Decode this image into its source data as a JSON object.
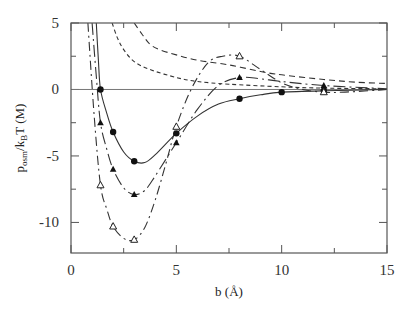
{
  "chart_data": {
    "type": "line",
    "title": "",
    "xlabel": "b  (Å)",
    "ylabel": "p_osm/k_BT (M)",
    "ylabel_parts": {
      "p": "p",
      "sub1": "osm",
      "mid": "/k",
      "sub2": "B",
      "end": "T (M)"
    },
    "xlim": [
      0,
      15
    ],
    "ylim": [
      -12.3,
      5
    ],
    "xticks": [
      0,
      5,
      10,
      15
    ],
    "yticks": [
      5,
      0,
      -5,
      -10
    ],
    "xtick_labels": [
      "0",
      "5",
      "10",
      "15"
    ],
    "ytick_labels": [
      "5",
      "0",
      "-5",
      "-10"
    ],
    "x_minor_ticks": [
      2.5,
      7.5,
      12.5
    ],
    "y_minor_ticks": [
      2.5,
      -2.5,
      -7.5
    ],
    "grid": false,
    "zero_line": true,
    "legend": null,
    "series": [
      {
        "name": "solid-filled-circles",
        "style": "solid",
        "marker": "filled-circle",
        "curve": [
          [
            1.2,
            5
          ],
          [
            1.3,
            2.2
          ],
          [
            1.4,
            0
          ],
          [
            1.7,
            -1.8
          ],
          [
            2,
            -3.2
          ],
          [
            2.5,
            -4.7
          ],
          [
            3,
            -5.4
          ],
          [
            3.5,
            -5.5
          ],
          [
            4,
            -4.9
          ],
          [
            5,
            -3.3
          ],
          [
            6,
            -2
          ],
          [
            7,
            -1.1
          ],
          [
            8,
            -0.7
          ],
          [
            9,
            -0.4
          ],
          [
            10,
            -0.2
          ],
          [
            12,
            -0.1
          ],
          [
            15,
            0
          ]
        ],
        "points": [
          [
            1.4,
            0
          ],
          [
            2,
            -3.2
          ],
          [
            3,
            -5.4
          ],
          [
            5,
            -3.3
          ],
          [
            8,
            -0.7
          ],
          [
            10,
            -0.2
          ],
          [
            12,
            -0.1
          ]
        ]
      },
      {
        "name": "long-dash-dot-filled-triangles",
        "style": "long-dash-dot",
        "marker": "filled-triangle",
        "curve": [
          [
            1.0,
            5
          ],
          [
            1.2,
            1
          ],
          [
            1.4,
            -2.5
          ],
          [
            1.7,
            -4.5
          ],
          [
            2,
            -6
          ],
          [
            2.5,
            -7.4
          ],
          [
            3,
            -7.9
          ],
          [
            3.5,
            -7.6
          ],
          [
            4,
            -6.5
          ],
          [
            5,
            -4
          ],
          [
            6,
            -1.5
          ],
          [
            7,
            0.3
          ],
          [
            8,
            0.9
          ],
          [
            9,
            0.8
          ],
          [
            10,
            0.6
          ],
          [
            12,
            0.3
          ],
          [
            15,
            0.05
          ]
        ],
        "points": [
          [
            1.4,
            -2.5
          ],
          [
            2,
            -6
          ],
          [
            3,
            -7.9
          ],
          [
            5,
            -4
          ],
          [
            8,
            0.9
          ],
          [
            12,
            0.3
          ]
        ]
      },
      {
        "name": "dash-dot-open-triangles",
        "style": "dash-dot",
        "marker": "open-triangle",
        "curve": [
          [
            0.8,
            5
          ],
          [
            1.1,
            -2
          ],
          [
            1.4,
            -7.2
          ],
          [
            1.7,
            -9
          ],
          [
            2,
            -10.3
          ],
          [
            2.5,
            -11.2
          ],
          [
            3,
            -11.3
          ],
          [
            3.5,
            -10.4
          ],
          [
            4,
            -8.3
          ],
          [
            4.5,
            -5.6
          ],
          [
            5,
            -2.8
          ],
          [
            5.7,
            0
          ],
          [
            6.5,
            2
          ],
          [
            7.2,
            2.5
          ],
          [
            8,
            2.5
          ],
          [
            9,
            1.5
          ],
          [
            10,
            0.5
          ],
          [
            11,
            0
          ],
          [
            12,
            -0.2
          ],
          [
            13,
            -0.2
          ],
          [
            15,
            0
          ]
        ],
        "points": [
          [
            1.4,
            -7.2
          ],
          [
            2,
            -10.3
          ],
          [
            3,
            -11.3
          ],
          [
            5,
            -2.8
          ],
          [
            8,
            2.5
          ],
          [
            12,
            -0.2
          ]
        ]
      },
      {
        "name": "upper-dashed",
        "style": "dashed",
        "marker": null,
        "curve": [
          [
            3,
            5
          ],
          [
            3.4,
            4.1
          ],
          [
            3.75,
            3.4
          ],
          [
            4.2,
            3
          ],
          [
            5,
            2.6
          ],
          [
            6,
            2.2
          ],
          [
            7.5,
            1.85
          ],
          [
            9,
            1.35
          ],
          [
            10,
            1.1
          ],
          [
            12,
            0.75
          ],
          [
            13.5,
            0.55
          ],
          [
            15,
            0.45
          ]
        ],
        "points": []
      },
      {
        "name": "lower-short-dash",
        "style": "short-dash",
        "marker": null,
        "curve": [
          [
            1.95,
            5
          ],
          [
            2.2,
            3.9
          ],
          [
            2.5,
            3
          ],
          [
            3,
            2.1
          ],
          [
            3.75,
            1.5
          ],
          [
            5,
            0.9
          ],
          [
            6,
            0.6
          ],
          [
            7.5,
            0.4
          ],
          [
            10,
            0.2
          ],
          [
            12,
            0.1
          ],
          [
            15,
            0.05
          ]
        ],
        "points": []
      }
    ]
  }
}
